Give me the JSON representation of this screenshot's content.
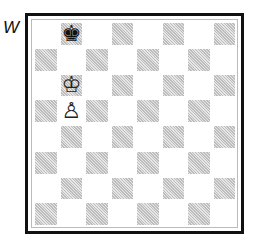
{
  "side_to_move_label": "W",
  "board": {
    "files": [
      "a",
      "b",
      "c",
      "d",
      "e",
      "f",
      "g",
      "h"
    ],
    "ranks": [
      8,
      7,
      6,
      5,
      4,
      3,
      2,
      1
    ],
    "pieces": {
      "b8": {
        "glyph": "♚",
        "name": "black-king",
        "color": "black"
      },
      "b6": {
        "glyph": "♔",
        "name": "white-king",
        "color": "white"
      },
      "b5": {
        "glyph": "♙",
        "name": "white-pawn",
        "color": "white"
      }
    }
  }
}
